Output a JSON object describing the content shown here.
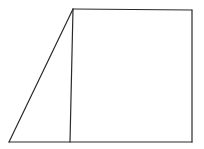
{
  "diagram": {
    "type": "geometry",
    "stroke_color": "#2a2a2a",
    "background": "#ffffff",
    "shapes": {
      "triangle": {
        "points": [
          [
            9,
            142
          ],
          [
            73,
            9
          ],
          [
            70,
            142
          ]
        ]
      },
      "rectangle": {
        "points": [
          [
            73,
            9
          ],
          [
            192,
            10
          ],
          [
            192,
            142
          ],
          [
            70,
            142
          ]
        ]
      }
    },
    "segments": [
      {
        "name": "slanted-edge",
        "from": [
          9,
          142
        ],
        "to": [
          73,
          9
        ]
      },
      {
        "name": "top-edge",
        "from": [
          73,
          9
        ],
        "to": [
          192,
          10
        ]
      },
      {
        "name": "right-edge",
        "from": [
          192,
          10
        ],
        "to": [
          192,
          142
        ]
      },
      {
        "name": "bottom-edge",
        "from": [
          9,
          142
        ],
        "to": [
          192,
          142
        ]
      },
      {
        "name": "dividing-edge",
        "from": [
          73,
          9
        ],
        "to": [
          70,
          142
        ]
      }
    ]
  }
}
